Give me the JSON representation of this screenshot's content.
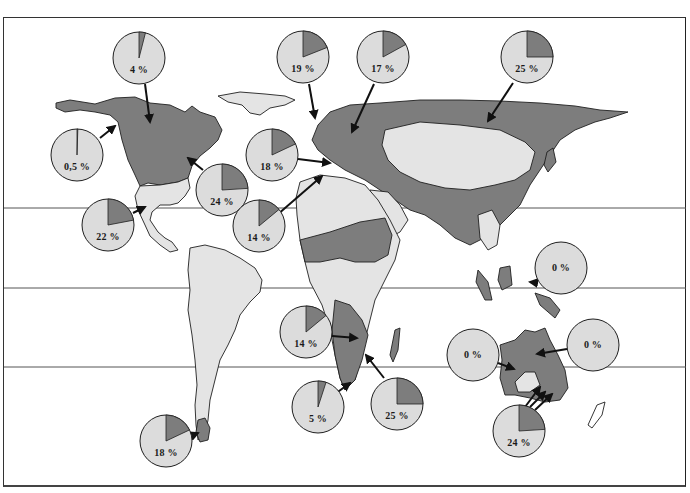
{
  "map": {
    "colors": {
      "land_low": "#e4e4e4",
      "land_high": "#7d7d7d",
      "pie_fill": "#dcdcdc",
      "pie_slice": "#7d7d7d",
      "outline": "#1f1f1f",
      "gridline": "#555555"
    },
    "reference_lines_y": [
      208,
      288,
      367
    ],
    "pies": [
      {
        "id": "canada-north",
        "label": "4 %",
        "value": 4,
        "cx": 139,
        "cy": 58
      },
      {
        "id": "uk",
        "label": "19 %",
        "value": 19,
        "cx": 303,
        "cy": 57
      },
      {
        "id": "scandinavia",
        "label": "17 %",
        "value": 17,
        "cx": 383,
        "cy": 57
      },
      {
        "id": "siberia",
        "label": "25 %",
        "value": 25,
        "cx": 527,
        "cy": 57
      },
      {
        "id": "alaska",
        "label": "0,5 %",
        "value": 0.5,
        "cx": 77,
        "cy": 155
      },
      {
        "id": "western-europe",
        "label": "18 %",
        "value": 18,
        "cx": 272,
        "cy": 155
      },
      {
        "id": "great-lakes",
        "label": "24 %",
        "value": 24,
        "cx": 222,
        "cy": 190
      },
      {
        "id": "mexico",
        "label": "22 %",
        "value": 22,
        "cx": 108,
        "cy": 225
      },
      {
        "id": "north-africa",
        "label": "14 %",
        "value": 14,
        "cx": 259,
        "cy": 226
      },
      {
        "id": "southeast-asia",
        "label": "0 %",
        "value": 0,
        "cx": 561,
        "cy": 268
      },
      {
        "id": "east-africa",
        "label": "14 %",
        "value": 14,
        "cx": 306,
        "cy": 332
      },
      {
        "id": "australia-west",
        "label": "0 %",
        "value": 0,
        "cx": 473,
        "cy": 355
      },
      {
        "id": "australia-east",
        "label": "0 %",
        "value": 0,
        "cx": 593,
        "cy": 345
      },
      {
        "id": "south-africa",
        "label": "5 %",
        "value": 5,
        "cx": 318,
        "cy": 407
      },
      {
        "id": "madagascar-region",
        "label": "25 %",
        "value": 25,
        "cx": 397,
        "cy": 404
      },
      {
        "id": "australia-south",
        "label": "24 %",
        "value": 24,
        "cx": 519,
        "cy": 431
      },
      {
        "id": "patagonia",
        "label": "18 %",
        "value": 18,
        "cx": 166,
        "cy": 441
      }
    ]
  }
}
